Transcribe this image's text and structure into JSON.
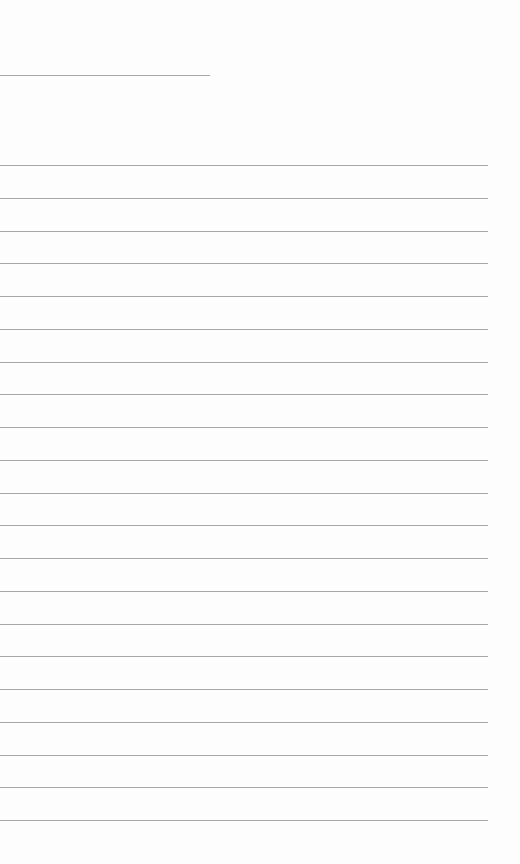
{
  "page": {
    "type": "lined-paper",
    "background": "#fdfdfd",
    "line_color": "#a8a8a8",
    "header_line": {
      "top": 75,
      "width": 210
    },
    "ruled_lines": {
      "count": 21,
      "first_top": 165,
      "spacing": 32.75,
      "width": 488
    }
  }
}
